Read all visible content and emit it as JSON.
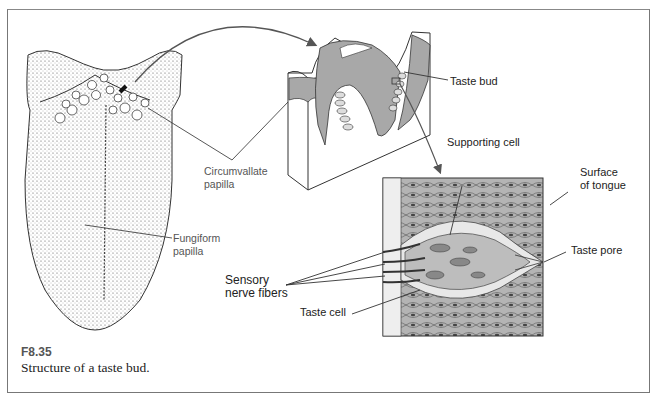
{
  "figure": {
    "number": "F8.35",
    "caption": "Structure of a taste bud."
  },
  "labels": {
    "circumvallate_papilla": "Circumvallate\npapilla",
    "fungiform_papilla": "Fungiform\npapilla",
    "taste_bud": "Taste bud",
    "supporting_cell": "Supporting cell",
    "surface_of_tongue": "Surface\nof tongue",
    "taste_pore": "Taste pore",
    "sensory_nerve_fibers": "Sensory\nnerve fibers",
    "taste_cell": "Taste cell"
  },
  "colors": {
    "tissue_gray": "#a8a8a8",
    "line": "#333333",
    "frame": "#777777"
  }
}
